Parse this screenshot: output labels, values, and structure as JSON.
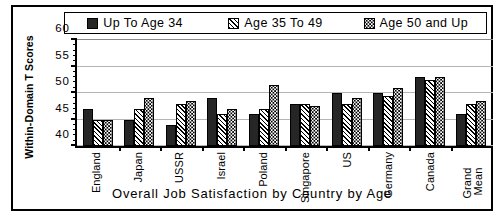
{
  "chart_data": {
    "type": "bar",
    "title": "",
    "xlabel": "Overall Job Satisfaction by Country by Age",
    "ylabel": "Within-Domain T Scores",
    "ylim": [
      40,
      60
    ],
    "yticks": [
      40,
      45,
      50,
      55,
      60
    ],
    "minor_tick_step": 1,
    "grid": true,
    "legend_position": "top",
    "categories": [
      "England",
      "Japan",
      "USSR",
      "Israel",
      "Poland",
      "Singapore",
      "US",
      "Germany",
      "Canada",
      "Grand Mean"
    ],
    "series": [
      {
        "name": "Up To Age 34",
        "fill": "solid",
        "values": [
          47.0,
          45.0,
          44.0,
          49.0,
          46.0,
          48.0,
          50.0,
          50.0,
          53.0,
          46.0
        ]
      },
      {
        "name": "Age 35 To 49",
        "fill": "hatch",
        "values": [
          45.0,
          47.0,
          48.0,
          46.0,
          47.0,
          48.0,
          48.0,
          49.5,
          52.5,
          48.0
        ]
      },
      {
        "name": "Age 50 and Up",
        "fill": "dots",
        "values": [
          45.0,
          49.0,
          48.5,
          47.0,
          51.5,
          47.5,
          49.0,
          51.0,
          53.0,
          48.5
        ]
      }
    ]
  },
  "legend": {
    "entries": [
      {
        "label": "Up To Age 34",
        "swatch": "solid-swatch"
      },
      {
        "label": "Age 35 To 49",
        "swatch": "hatch-swatch"
      },
      {
        "label": "Age 50 and Up",
        "swatch": "dots-swatch"
      }
    ]
  },
  "axis": {
    "y_title": "Within-Domain T Scores",
    "x_title": "Overall Job Satisfaction by Country by Age",
    "y_tick_labels": [
      "60",
      "55",
      "50",
      "45",
      "40"
    ]
  },
  "colors": {
    "series_solid": "#262626",
    "series_hatch": "#000000",
    "series_dots": "#000000",
    "gridline": "#b5b5b5",
    "axis": "#000000",
    "background": "#ffffff"
  }
}
